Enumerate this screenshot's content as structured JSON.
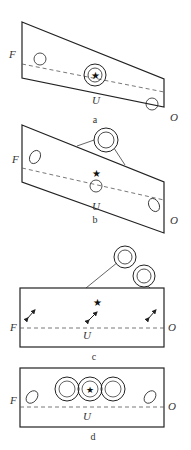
{
  "panels": [
    {
      "id": "a",
      "caption": "a",
      "left_label": "F",
      "right_label": "O",
      "center_label": "U"
    },
    {
      "id": "b",
      "caption": "b",
      "left_label": "F",
      "right_label": "O",
      "center_label": "U"
    },
    {
      "id": "c",
      "caption": "c",
      "left_label": "F",
      "right_label": "O",
      "center_label": "U"
    },
    {
      "id": "d",
      "caption": "d",
      "left_label": "F",
      "right_label": "O",
      "center_label": "U"
    }
  ],
  "colors": {
    "stroke": "#222222",
    "dash": "#555555",
    "background": "#ffffff"
  }
}
